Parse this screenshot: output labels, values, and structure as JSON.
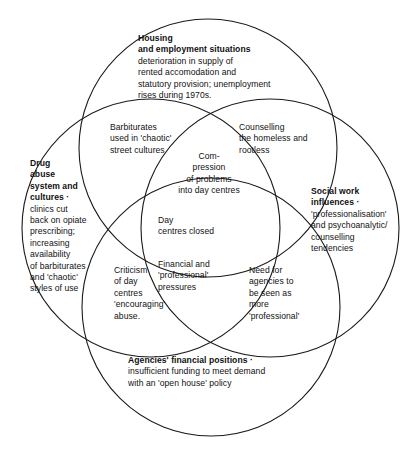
{
  "diagram": {
    "type": "venn-4-circle",
    "stroke_color": "#1a1a1a",
    "fill_color": "none",
    "background": "#ffffff",
    "circles": [
      {
        "id": "housing",
        "position": "top",
        "cx": 208,
        "cy": 148,
        "r": 129
      },
      {
        "id": "drug",
        "position": "left",
        "cx": 151,
        "cy": 228,
        "r": 129
      },
      {
        "id": "social",
        "position": "right",
        "cx": 270,
        "cy": 228,
        "r": 129
      },
      {
        "id": "agencies",
        "position": "bottom",
        "cx": 211,
        "cy": 307,
        "r": 129
      }
    ]
  },
  "sets": {
    "housing": {
      "title": "Housing\nand employment situations",
      "body": "deterioration in supply of\nrented accomodation and\nstatutory provision; unemployment\nrises during 1970s."
    },
    "drug": {
      "title": "Drug\nabuse\nsystem and\ncultures ·",
      "body": "clinics cut\nback on opiate\nprescribing;\nincreasing\navailability\nof barbiturates\nand 'chaotic'\nstyles of use"
    },
    "social": {
      "title": "Social work\ninfluences ·",
      "body": "'professionalisation'\nand psychoanalytic/\ncounselling\ntendencies"
    },
    "agencies": {
      "title": "Agencies' financial positions ·",
      "body": "insufficient funding to meet demand\nwith an 'open house' policy"
    }
  },
  "intersections": {
    "housing_drug": "Barbiturates\nused in 'chaotic'\nstreet cultures",
    "housing_social": "Counselling\nthe homeless and\nrootless",
    "housing_drug_social": "Com-\npression\nof problems\ninto day centres",
    "center_all_four": "Day\ncentres closed",
    "drug_agencies": "Criticism\nof day\ncentres\n'encouraging'\nabuse.",
    "social_agencies": "Need for\nagencies to\nbe seen as\nmore\n'professional'",
    "drug_social_agencies": "Financial and\n'professional'\npressures"
  }
}
